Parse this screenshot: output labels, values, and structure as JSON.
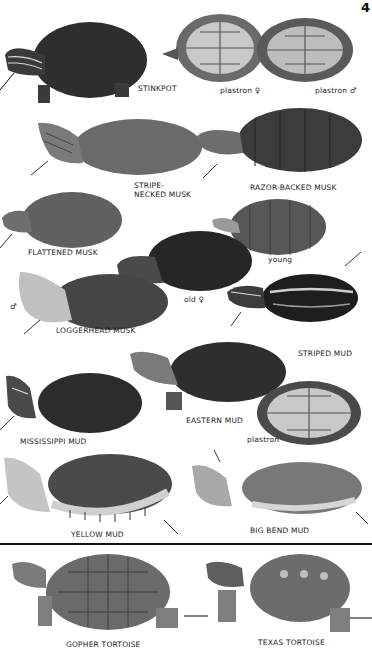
{
  "page": {
    "number": "4"
  },
  "species": [
    {
      "id": "stinkpot",
      "label": "STINKPOT"
    },
    {
      "id": "stinkpot-plastron-female",
      "label": "plastron ♀"
    },
    {
      "id": "stinkpot-plastron-male",
      "label": "plastron ♂"
    },
    {
      "id": "stripe-necked-musk",
      "label_line1": "STRIPE-",
      "label_line2": "NECKED MUSK"
    },
    {
      "id": "razor-backed-musk",
      "label": "RAZOR-BACKED MUSK"
    },
    {
      "id": "flattened-musk",
      "label": "FLATTENED MUSK"
    },
    {
      "id": "razor-backed-young",
      "label": "young"
    },
    {
      "id": "loggerhead-old-female",
      "label": "old ♀"
    },
    {
      "id": "loggerhead-musk",
      "label": "LOGGERHEAD MUSK",
      "sex": "♂"
    },
    {
      "id": "striped-mud",
      "label": "STRIPED MUD"
    },
    {
      "id": "eastern-mud",
      "label": "EASTERN MUD"
    },
    {
      "id": "eastern-mud-plastron",
      "label": "plastron"
    },
    {
      "id": "mississippi-mud",
      "label": "MISSISSIPPI MUD"
    },
    {
      "id": "yellow-mud",
      "label": "YELLOW MUD"
    },
    {
      "id": "big-bend-mud",
      "label": "BIG BEND MUD"
    },
    {
      "id": "gopher-tortoise",
      "label": "GOPHER TORTOISE"
    },
    {
      "id": "texas-tortoise",
      "label": "TEXAS TORTOISE"
    }
  ],
  "colors": {
    "dark": "#2b2b2b",
    "mid": "#555555",
    "light": "#8a8a8a",
    "pale": "#c8c8c8"
  }
}
